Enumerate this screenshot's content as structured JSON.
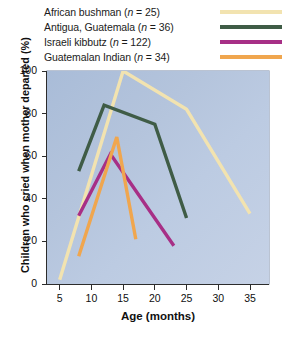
{
  "chart_data": {
    "type": "line",
    "title": "",
    "xlabel": "Age (months)",
    "ylabel": "Children who cried when mother departed (%)",
    "xlim": [
      3,
      38
    ],
    "ylim": [
      0,
      100
    ],
    "xticks": [
      5,
      10,
      15,
      20,
      25,
      30,
      35
    ],
    "yticks": [
      0,
      20,
      40,
      60,
      80,
      100
    ],
    "grid": false,
    "legend_position": "top",
    "plot_background": "#b4c4dc",
    "series": [
      {
        "name": "African bushman",
        "label": "African bushman (n = 25)",
        "n": 25,
        "color": "#f2e3b0",
        "x": [
          5,
          15,
          25,
          35
        ],
        "values": [
          2,
          100,
          82,
          33
        ]
      },
      {
        "name": "Antigua, Guatemala",
        "label": "Antigua, Guatemala (n = 36)",
        "n": 36,
        "color": "#3f5c46",
        "x": [
          8,
          12,
          20,
          25
        ],
        "values": [
          53,
          84,
          75,
          31
        ]
      },
      {
        "name": "Israeli kibbutz",
        "label": "Israeli kibbutz (n = 122)",
        "n": 122,
        "color": "#a72f86",
        "x": [
          8,
          13,
          23
        ],
        "values": [
          32,
          61,
          18
        ]
      },
      {
        "name": "Guatemalan Indian",
        "label": "Guatemalan Indian (n = 34)",
        "n": 34,
        "color": "#f0a64e",
        "x": [
          8,
          14,
          17
        ],
        "values": [
          13,
          69,
          21
        ]
      }
    ]
  },
  "legend": {
    "rows": [
      {
        "text_a": "African bushman (",
        "text_n": "n",
        "text_b": " = 25)",
        "color": "#f2e3b0"
      },
      {
        "text_a": "Antigua, Guatemala (",
        "text_n": "n",
        "text_b": " = 36)",
        "color": "#3f5c46"
      },
      {
        "text_a": "Israeli kibbutz (",
        "text_n": "n",
        "text_b": " = 122)",
        "color": "#a72f86"
      },
      {
        "text_a": "Guatemalan Indian (",
        "text_n": "n",
        "text_b": " = 34)",
        "color": "#f0a64e"
      }
    ]
  },
  "axes": {
    "y_title": "Children who cried when mother departed (%)",
    "x_title": "Age (months)",
    "y_tick_labels": [
      "100",
      "80",
      "60",
      "40",
      "20",
      "0"
    ],
    "x_tick_labels": [
      "5",
      "10",
      "15",
      "20",
      "25",
      "30",
      "35"
    ]
  }
}
